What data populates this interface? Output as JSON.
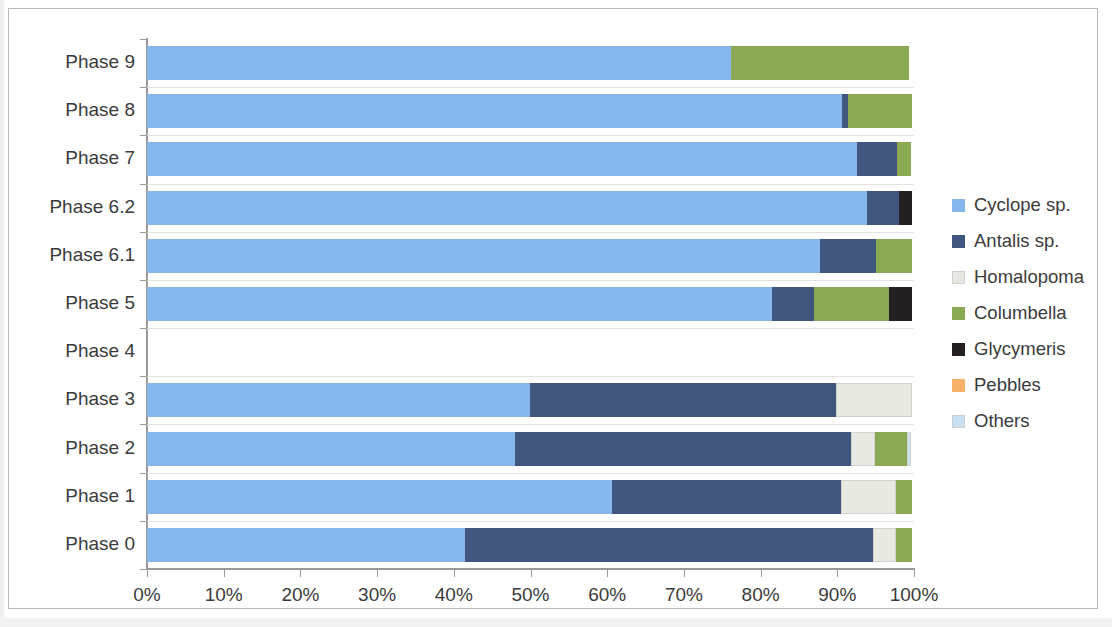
{
  "chart_data": {
    "type": "bar",
    "orientation": "horizontal",
    "stacked": true,
    "normalized": true,
    "title": "",
    "xlabel": "",
    "ylabel": "",
    "xlim": [
      0,
      100
    ],
    "xticks": [
      "0%",
      "10%",
      "20%",
      "30%",
      "40%",
      "50%",
      "60%",
      "70%",
      "80%",
      "90%",
      "100%"
    ],
    "xtick_values": [
      0,
      10,
      20,
      30,
      40,
      50,
      60,
      70,
      80,
      90,
      100
    ],
    "grid": true,
    "legend_position": "right",
    "categories": [
      "Phase 9",
      "Phase 8",
      "Phase 7",
      "Phase 6.2",
      "Phase 6.1",
      "Phase 5",
      "Phase 4",
      "Phase 3",
      "Phase 2",
      "Phase 1",
      "Phase 0"
    ],
    "series": [
      {
        "name": "Cyclope sp.",
        "color": "#85b6ec",
        "values": [
          76.1,
          90.6,
          92.6,
          93.9,
          87.7,
          81.5,
          0,
          49.9,
          48.0,
          60.6,
          41.5
        ]
      },
      {
        "name": "Antalis sp.",
        "color": "#41567e",
        "values": [
          0,
          0.8,
          5.2,
          4.2,
          7.3,
          5.5,
          0,
          39.9,
          43.8,
          29.9,
          53.2
        ]
      },
      {
        "name": "Homalopoma",
        "color": "#e9e9e4",
        "values": [
          0,
          0,
          0,
          0,
          0,
          0,
          0,
          9.9,
          3.1,
          7.2,
          2.9
        ]
      },
      {
        "name": "Columbella",
        "color": "#8aa952",
        "values": [
          23.2,
          8.3,
          1.8,
          0,
          4.7,
          9.8,
          0,
          0,
          4.2,
          2.0,
          2.1
        ]
      },
      {
        "name": "Glycymeris",
        "color": "#241f20",
        "values": [
          0,
          0,
          0,
          1.6,
          0,
          2.9,
          0,
          0,
          0,
          0,
          0
        ]
      },
      {
        "name": "Pebbles",
        "color": "#f7b26a",
        "values": [
          0,
          0,
          0,
          0,
          0,
          0,
          0,
          0,
          0,
          0,
          0
        ]
      },
      {
        "name": "Others",
        "color": "#c9e0f4",
        "values": [
          0,
          0,
          0,
          0,
          0,
          0,
          0,
          0,
          0.5,
          0,
          0
        ]
      }
    ]
  },
  "legend": {
    "items": [
      {
        "label": "Cyclope sp.",
        "color": "#85b6ec"
      },
      {
        "label": "Antalis sp.",
        "color": "#41567e"
      },
      {
        "label": "Homalopoma",
        "color": "#e9e9e4"
      },
      {
        "label": "Columbella",
        "color": "#8aa952"
      },
      {
        "label": "Glycymeris",
        "color": "#241f20"
      },
      {
        "label": "Pebbles",
        "color": "#f7b26a"
      },
      {
        "label": "Others",
        "color": "#c9e0f4"
      }
    ]
  },
  "axes": {
    "y_labels": [
      "Phase 9",
      "Phase 8",
      "Phase 7",
      "Phase 6.2",
      "Phase 6.1",
      "Phase 5",
      "Phase 4",
      "Phase 3",
      "Phase 2",
      "Phase 1",
      "Phase 0"
    ],
    "x_labels": [
      "0%",
      "10%",
      "20%",
      "30%",
      "40%",
      "50%",
      "60%",
      "70%",
      "80%",
      "90%",
      "100%"
    ]
  }
}
